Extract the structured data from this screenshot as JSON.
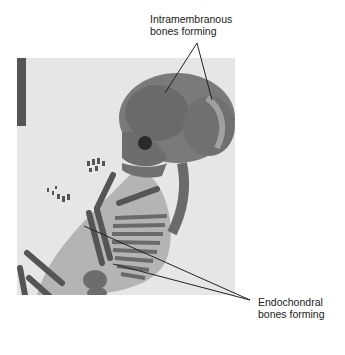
{
  "figure": {
    "labels": {
      "intramembranous": {
        "line1": "Intramembranous",
        "line2": "bones forming"
      },
      "endochondral": {
        "line1": "Endochondral",
        "line2": "bones forming"
      }
    },
    "colors": {
      "background": "#ffffff",
      "photo_background": "#e8e8e8",
      "bone": "#5a5a5a",
      "tissue": "#9a9a9a",
      "text": "#222222"
    }
  }
}
